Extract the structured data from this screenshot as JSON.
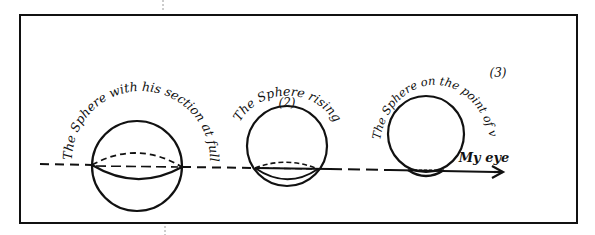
{
  "diagram": {
    "type": "hand-drawn perspective sketch",
    "labels": {
      "sphere1_caption": "The Sphere with his section at full Size",
      "sphere2_number": "(2)",
      "sphere2_caption": "The Sphere rising",
      "sphere3_number": "(3)",
      "sphere3_caption": "The Sphere on the point of vanishing",
      "eye_label": "My eye"
    },
    "elements": [
      {
        "id": "sphere-1",
        "caption": "The Sphere with his section at full Size",
        "section": "full-size ellipse on horizon"
      },
      {
        "id": "sphere-2",
        "number": "(2)",
        "caption": "The Sphere rising",
        "section": "smaller ellipse near bottom"
      },
      {
        "id": "sphere-3",
        "number": "(3)",
        "caption": "The Sphere on the point of vanishing",
        "section": "tiny sliver at bottom"
      },
      {
        "id": "eye",
        "label": "My eye",
        "marker": "arrowhead at end of sight line"
      }
    ],
    "colors": {
      "ink": "#111111",
      "paper": "#ffffff",
      "guide": "#9a9a9a"
    }
  }
}
